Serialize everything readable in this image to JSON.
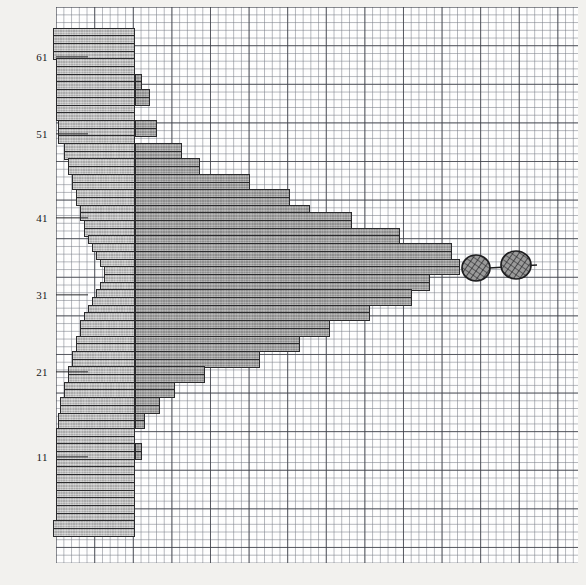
{
  "figure": {
    "kind": "graph-paper-bar-profile",
    "background_color": "#f2f1ee",
    "plot_background_color": "#ffffff"
  },
  "grid": {
    "minor_cell_px": 7.72,
    "major_every_cells": 5,
    "minor_color": "#787c86",
    "major_color": "#3c3e46",
    "left_px": 56,
    "top_px": 7,
    "width_px": 522,
    "height_px": 556
  },
  "axes": {
    "y_ticks": [
      {
        "label": "61",
        "y": 57
      },
      {
        "label": "51",
        "y": 134
      },
      {
        "label": "41",
        "y": 218
      },
      {
        "label": "31",
        "y": 295
      },
      {
        "label": "21",
        "y": 372
      },
      {
        "label": "11",
        "y": 457
      }
    ],
    "y_tick_line_length": 32,
    "y_tick_color": "#2a2a2c",
    "baseline_x": 135
  },
  "colors": {
    "bar_fill_right": "#9d9d9d",
    "bar_fill_left": "#b9b9b9",
    "bar_outline": "#2a2a2c",
    "marker_fill": "#9a9a9a",
    "marker_outline": "#1d1d1f",
    "text": "#17171a"
  },
  "chart_data": {
    "type": "bar",
    "orientation": "horizontal",
    "title": "",
    "xlabel": "",
    "ylabel": "",
    "grid": true,
    "legend": false,
    "baseline_x_px": 135,
    "row_height_px": 7.72,
    "note": "Diverging horizontal bars: each row has a left extent and a right extent measured in pixels from the plot left edge.",
    "rows": [
      {
        "y": 27.5,
        "left": 53,
        "right": 135
      },
      {
        "y": 35.2,
        "left": 53,
        "right": 135
      },
      {
        "y": 42.9,
        "left": 53,
        "right": 135
      },
      {
        "y": 50.6,
        "left": 53,
        "right": 135
      },
      {
        "y": 58.3,
        "left": 56,
        "right": 135
      },
      {
        "y": 66.0,
        "left": 56,
        "right": 135
      },
      {
        "y": 73.7,
        "left": 56,
        "right": 142
      },
      {
        "y": 81.4,
        "left": 56,
        "right": 142
      },
      {
        "y": 89.1,
        "left": 56,
        "right": 150
      },
      {
        "y": 96.8,
        "left": 56,
        "right": 150
      },
      {
        "y": 104.5,
        "left": 56,
        "right": 135
      },
      {
        "y": 112.2,
        "left": 56,
        "right": 135
      },
      {
        "y": 119.9,
        "left": 58,
        "right": 157
      },
      {
        "y": 127.6,
        "left": 58,
        "right": 157
      },
      {
        "y": 135.3,
        "left": 58,
        "right": 135
      },
      {
        "y": 143.0,
        "left": 64,
        "right": 182
      },
      {
        "y": 150.7,
        "left": 64,
        "right": 182
      },
      {
        "y": 158.4,
        "left": 68,
        "right": 200
      },
      {
        "y": 166.1,
        "left": 68,
        "right": 200
      },
      {
        "y": 173.8,
        "left": 72,
        "right": 250
      },
      {
        "y": 181.5,
        "left": 72,
        "right": 250
      },
      {
        "y": 189.2,
        "left": 76,
        "right": 290
      },
      {
        "y": 196.9,
        "left": 76,
        "right": 290
      },
      {
        "y": 204.6,
        "left": 80,
        "right": 310
      },
      {
        "y": 212.3,
        "left": 80,
        "right": 352
      },
      {
        "y": 220.0,
        "left": 84,
        "right": 352
      },
      {
        "y": 227.7,
        "left": 84,
        "right": 400
      },
      {
        "y": 235.4,
        "left": 88,
        "right": 400
      },
      {
        "y": 243.1,
        "left": 92,
        "right": 452
      },
      {
        "y": 250.8,
        "left": 96,
        "right": 452
      },
      {
        "y": 258.5,
        "left": 100,
        "right": 460
      },
      {
        "y": 266.2,
        "left": 104,
        "right": 460
      },
      {
        "y": 273.9,
        "left": 104,
        "right": 430
      },
      {
        "y": 281.6,
        "left": 100,
        "right": 430
      },
      {
        "y": 289.3,
        "left": 96,
        "right": 412
      },
      {
        "y": 297.0,
        "left": 92,
        "right": 412
      },
      {
        "y": 304.7,
        "left": 88,
        "right": 370
      },
      {
        "y": 312.4,
        "left": 84,
        "right": 370
      },
      {
        "y": 320.1,
        "left": 80,
        "right": 330
      },
      {
        "y": 327.8,
        "left": 80,
        "right": 330
      },
      {
        "y": 335.5,
        "left": 76,
        "right": 300
      },
      {
        "y": 343.2,
        "left": 76,
        "right": 300
      },
      {
        "y": 350.9,
        "left": 72,
        "right": 260
      },
      {
        "y": 358.6,
        "left": 72,
        "right": 260
      },
      {
        "y": 366.3,
        "left": 68,
        "right": 205
      },
      {
        "y": 374.0,
        "left": 68,
        "right": 205
      },
      {
        "y": 381.7,
        "left": 64,
        "right": 175
      },
      {
        "y": 389.4,
        "left": 64,
        "right": 175
      },
      {
        "y": 397.1,
        "left": 60,
        "right": 160
      },
      {
        "y": 404.8,
        "left": 60,
        "right": 160
      },
      {
        "y": 412.5,
        "left": 58,
        "right": 145
      },
      {
        "y": 420.2,
        "left": 58,
        "right": 145
      },
      {
        "y": 427.9,
        "left": 56,
        "right": 135
      },
      {
        "y": 435.6,
        "left": 56,
        "right": 135
      },
      {
        "y": 443.3,
        "left": 56,
        "right": 142
      },
      {
        "y": 451.0,
        "left": 56,
        "right": 142
      },
      {
        "y": 458.7,
        "left": 56,
        "right": 135
      },
      {
        "y": 466.4,
        "left": 56,
        "right": 135
      },
      {
        "y": 474.1,
        "left": 56,
        "right": 135
      },
      {
        "y": 481.8,
        "left": 56,
        "right": 135
      },
      {
        "y": 489.5,
        "left": 56,
        "right": 135
      },
      {
        "y": 497.2,
        "left": 56,
        "right": 135
      },
      {
        "y": 504.9,
        "left": 56,
        "right": 135
      },
      {
        "y": 512.6,
        "left": 56,
        "right": 135
      },
      {
        "y": 520.3,
        "left": 53,
        "right": 135
      },
      {
        "y": 528.0,
        "left": 53,
        "right": 135
      }
    ],
    "markers": [
      {
        "name": "marker-left",
        "cx": 476,
        "cy": 268,
        "rx": 14,
        "ry": 13
      },
      {
        "name": "marker-right",
        "cx": 516,
        "cy": 265,
        "rx": 15,
        "ry": 14
      }
    ],
    "connector": {
      "x1": 489,
      "y1": 268,
      "x2": 537,
      "y2": 265
    }
  }
}
